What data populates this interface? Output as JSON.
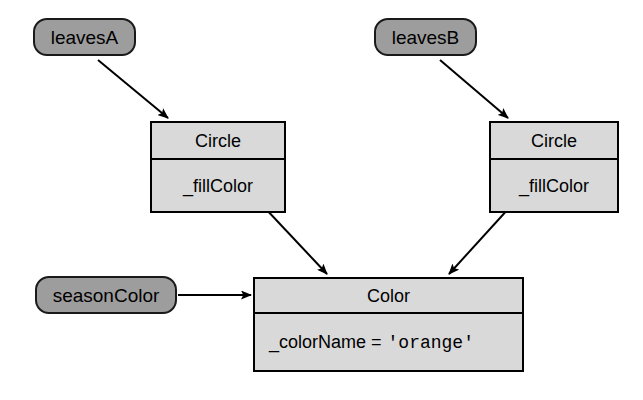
{
  "diagram": {
    "background_color": "#ffffff",
    "variable_fill_color": "#9d9d9d",
    "object_fill_color": "#d9d9d9",
    "stroke_color": "#000000"
  },
  "variables": [
    {
      "id": "leavesA",
      "label": "leavesA"
    },
    {
      "id": "leavesB",
      "label": "leavesB"
    },
    {
      "id": "seasonColor",
      "label": "seasonColor"
    }
  ],
  "objects": [
    {
      "id": "circleA",
      "title": "Circle",
      "field_name": "_fillColor",
      "field_value": ""
    },
    {
      "id": "circleB",
      "title": "Circle",
      "field_name": "_fillColor",
      "field_value": ""
    },
    {
      "id": "color",
      "title": "Color",
      "field_name": "_colorName =",
      "field_value": "'orange'"
    }
  ],
  "edges": [
    {
      "id": "leavesA-to-circleA",
      "from": "leavesA",
      "to": "circleA",
      "style": "arrow"
    },
    {
      "id": "leavesB-to-circleB",
      "from": "leavesB",
      "to": "circleB",
      "style": "arrow"
    },
    {
      "id": "circleA-to-color",
      "from": "circleA",
      "to": "color",
      "style": "arrow"
    },
    {
      "id": "circleB-to-color",
      "from": "circleB",
      "to": "color",
      "style": "arrow"
    },
    {
      "id": "seasonColor-to-color",
      "from": "seasonColor",
      "to": "color",
      "style": "arrow"
    }
  ]
}
